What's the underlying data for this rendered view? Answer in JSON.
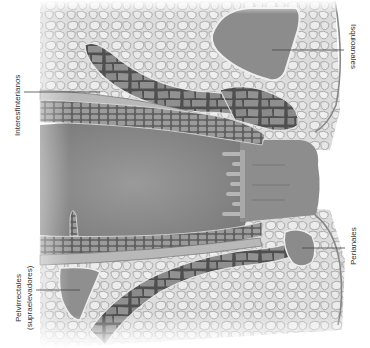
{
  "figure": {
    "labels": {
      "isquioanales": "Isquioanales",
      "interesfinterianos": "Interesfinterianos",
      "pelvirrectales_line1": "Pelvirrectales",
      "pelvirrectales_line2": "(supraelevadores)",
      "perianales": "Perianales"
    },
    "colors": {
      "background": "#ffffff",
      "fat_tissue": "#d9d9d9",
      "fat_cell_outline": "#9a9a9a",
      "lumen": "#8e8e8e",
      "muscle": "#7a7a7a",
      "muscle_band": "#b0b0b0",
      "abscess_space": "#8a8a8a",
      "leader_line": "#444444",
      "text": "#333333"
    }
  }
}
